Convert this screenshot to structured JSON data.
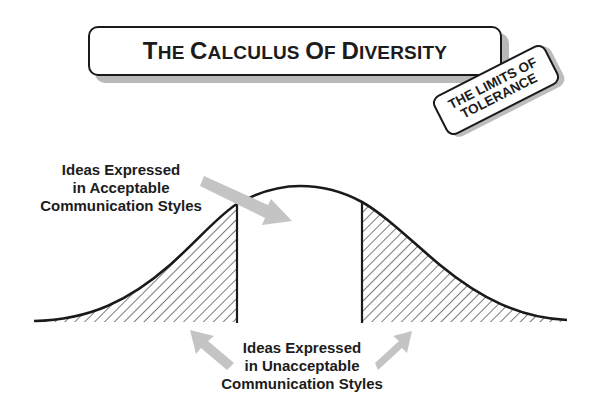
{
  "title": {
    "full": "THE CALCULUS OF DIVERSITY",
    "parts": [
      {
        "big": "T",
        "small": "HE "
      },
      {
        "big": "C",
        "small": "ALCULUS "
      },
      {
        "big": "O",
        "small": "F "
      },
      {
        "big": "D",
        "small": "IVERSITY"
      }
    ]
  },
  "tag": {
    "line1": "THE LIMITS OF",
    "line2": "TOLERANCE"
  },
  "labels": {
    "acceptable": {
      "line1": "Ideas Expressed",
      "line2": "in Acceptable",
      "line3": "Communication Styles"
    },
    "unacceptable": {
      "line1": "Ideas Expressed",
      "line2": "in Unacceptable",
      "line3": "Communication Styles"
    }
  },
  "diagram": {
    "type": "bell-curve",
    "curve_color": "#1a1a1a",
    "arrow_color": "#c4c4c4",
    "hatch_color": "#333333",
    "baseline_y": 322,
    "x_start": 34,
    "x_end": 567,
    "peak": {
      "x": 300,
      "y": 186
    },
    "left_cutoff_x": 237,
    "right_cutoff_x": 362,
    "regions": [
      {
        "name": "left-tail",
        "shaded": true,
        "meaning": "unacceptable"
      },
      {
        "name": "center",
        "shaded": false,
        "meaning": "acceptable"
      },
      {
        "name": "right-tail",
        "shaded": true,
        "meaning": "unacceptable"
      }
    ]
  }
}
